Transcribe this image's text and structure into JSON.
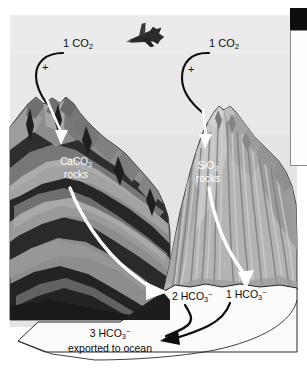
{
  "figure": {
    "name": "silicate-carbonate-weathering-diagram",
    "background_color": "#ffffff",
    "sky_color": "#e4e4e4"
  },
  "labels": {
    "co2_left": {
      "count": "1",
      "formula_prefix": "CO",
      "formula_sub": "2"
    },
    "co2_right": {
      "count": "1",
      "formula_prefix": "CO",
      "formula_sub": "2"
    },
    "plus_left": "+",
    "plus_right": "+",
    "rocks_left_line1_prefix": "CaCO",
    "rocks_left_line1_sub": "3",
    "rocks_left_line2": "rocks",
    "rocks_right_line1_prefix": "SiO",
    "rocks_right_line1_sub": "2",
    "rocks_right_line2": "rocks",
    "hco3_left": {
      "count": "2",
      "formula_prefix": "HCO",
      "formula_sub": "3",
      "formula_sup": "−"
    },
    "hco3_right": {
      "count": "1",
      "formula_prefix": "HCO",
      "formula_sub": "3",
      "formula_sup": "−"
    },
    "ocean_line1": {
      "count": "3",
      "formula_prefix": "HCO",
      "formula_sub": "3",
      "formula_sup": "−"
    },
    "ocean_line2": "exported to ocean"
  },
  "icons": {
    "airplane": "airplane-icon",
    "arrow_black_left": "curved-black-arrow-icon",
    "arrow_black_right": "curved-black-arrow-icon",
    "arrow_white_co2_left": "white-down-arrow-icon",
    "arrow_white_co2_right": "white-down-arrow-icon",
    "arrow_white_weather_left": "white-curved-arrow-icon",
    "arrow_white_weather_right": "white-curved-arrow-icon",
    "arrow_merge_left": "black-merge-arrow-icon",
    "arrow_merge_right": "black-merge-arrow-icon"
  },
  "colors": {
    "sky": "#e4e4e4",
    "carbonate_mountain_mid": "#8d8d8d",
    "carbonate_mountain_dark": "#2a2a2a",
    "carbonate_mountain_light": "#a9a9a9",
    "silicate_mountain_mid": "#b5b5b5",
    "silicate_mountain_light": "#cccccc",
    "silicate_mountain_dark": "#8f8f8f",
    "valley_floor": "#fbfbfb",
    "outline": "#111111",
    "white_arrow": "#ffffff",
    "black_arrow": "#0d0d0d"
  }
}
